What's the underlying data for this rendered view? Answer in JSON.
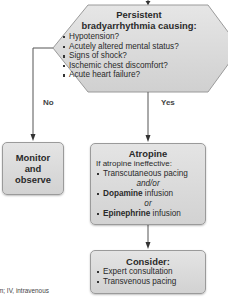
{
  "decision": {
    "title_line1": "Persistent",
    "title_line2": "bradyarrhythmia causing:",
    "items": [
      "Hypotension?",
      "Acutely altered mental status?",
      "Signs of shock?",
      "Ischemic chest discomfort?",
      "Acute heart failure?"
    ]
  },
  "branches": {
    "no_label": "No",
    "yes_label": "Yes"
  },
  "monitor": {
    "line1": "Monitor",
    "line2": "and",
    "line3": "observe"
  },
  "atropine": {
    "title": "Atropine",
    "subtitle": "If atropine ineffective:",
    "item1": "Transcutaneous pacing",
    "conj1": "and/or",
    "item2_bold": "Dopamine",
    "item2_rest": " infusion",
    "conj2": "or",
    "item3_bold": "Epinephrine",
    "item3_rest": " infusion"
  },
  "consider": {
    "title": "Consider:",
    "items": [
      "Expert consultation",
      "Transvenous pacing"
    ]
  },
  "footer": {
    "text": "m; IV, intravenous"
  },
  "colors": {
    "box_fill": "#d9d9d9",
    "box_border": "#9a9a9a",
    "line": "#555555",
    "text": "#2a2a2a"
  }
}
